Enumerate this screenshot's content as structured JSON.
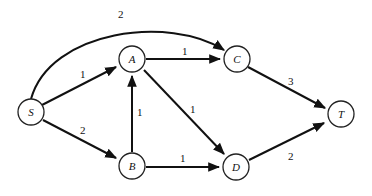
{
  "graph": {
    "nodes": [
      {
        "id": "S",
        "label": "S",
        "x": 31,
        "y": 112
      },
      {
        "id": "A",
        "label": "A",
        "x": 132,
        "y": 59
      },
      {
        "id": "C",
        "label": "C",
        "x": 237,
        "y": 59
      },
      {
        "id": "T",
        "label": "T",
        "x": 341,
        "y": 114
      },
      {
        "id": "B",
        "label": "B",
        "x": 132,
        "y": 166
      },
      {
        "id": "D",
        "label": "D",
        "x": 236,
        "y": 167
      }
    ],
    "edges": [
      {
        "from": "S",
        "to": "C",
        "weight": "2"
      },
      {
        "from": "S",
        "to": "A",
        "weight": "1"
      },
      {
        "from": "S",
        "to": "B",
        "weight": "2"
      },
      {
        "from": "A",
        "to": "C",
        "weight": "1"
      },
      {
        "from": "A",
        "to": "D",
        "weight": "1"
      },
      {
        "from": "B",
        "to": "A",
        "weight": "1"
      },
      {
        "from": "B",
        "to": "D",
        "weight": "1"
      },
      {
        "from": "C",
        "to": "T",
        "weight": "3"
      },
      {
        "from": "D",
        "to": "T",
        "weight": "2"
      }
    ]
  }
}
